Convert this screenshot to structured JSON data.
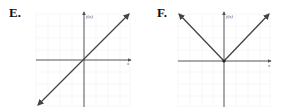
{
  "graphs": [
    {
      "label": "E.",
      "ylabel": "f(x)",
      "xlabel": "x",
      "description": "f(x) = x, line through origin with arrows both ends"
    },
    {
      "label": "F.",
      "ylabel": "f(x)",
      "xlabel": "x",
      "description": "f(x) = |x|, V shape with vertex at origin"
    }
  ],
  "colors": {
    "line": "#444444",
    "axis": "#555555",
    "grid": "#ececec"
  }
}
